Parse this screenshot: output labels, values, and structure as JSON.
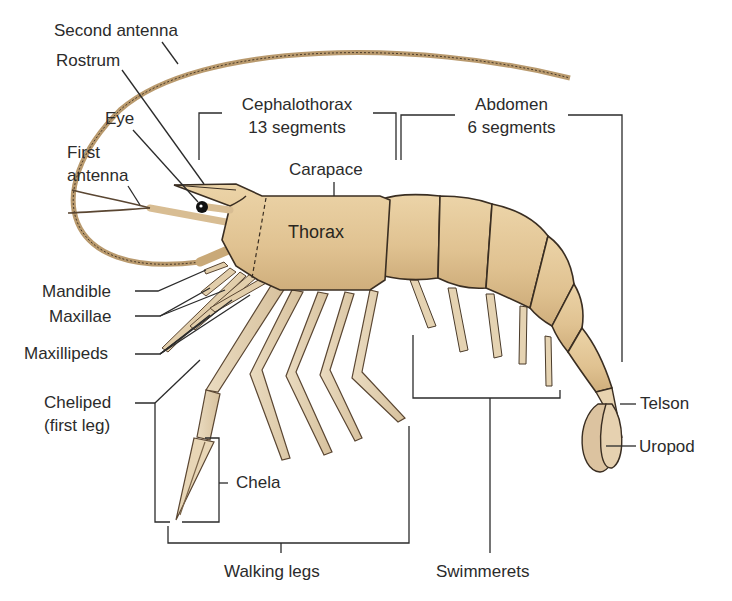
{
  "figure": {
    "colors": {
      "body": "#e3c79a",
      "body_shade": "#cfae7c",
      "leg": "#e6d3b3",
      "outline": "#3a2e22",
      "leader_line": "#2b2b2b",
      "eye": "#111111"
    }
  },
  "labels": {
    "second_antenna": "Second antenna",
    "rostrum": "Rostrum",
    "eye": "Eye",
    "first_antenna_line1": "First",
    "first_antenna_line2": "antenna",
    "cephalothorax_line1": "Cephalothorax",
    "cephalothorax_line2": "13 segments",
    "abdomen_line1": "Abdomen",
    "abdomen_line2": "6 segments",
    "carapace": "Carapace",
    "thorax": "Thorax",
    "mandible": "Mandible",
    "maxillae": "Maxillae",
    "maxillipeds": "Maxillipeds",
    "cheliped_line1": "Cheliped",
    "cheliped_line2": "(first leg)",
    "chela": "Chela",
    "walking_legs": "Walking legs",
    "swimmerets": "Swimmerets",
    "telson": "Telson",
    "uropod": "Uropod"
  }
}
